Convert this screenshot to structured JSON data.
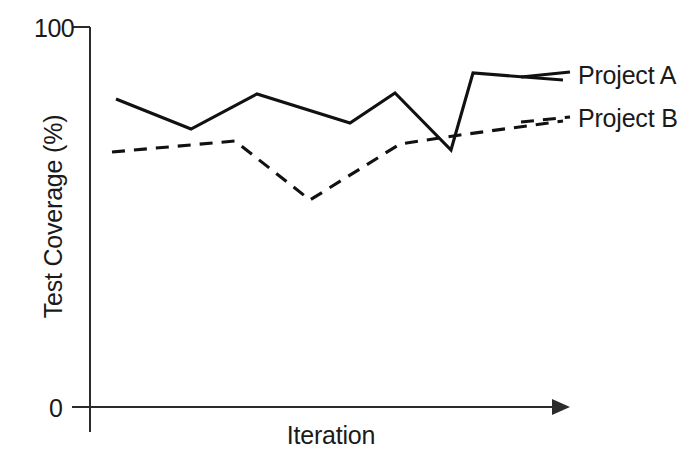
{
  "chart_data": {
    "type": "line",
    "title": "",
    "xlabel": "Iteration",
    "ylabel": "Test Coverage (%)",
    "ylim": [
      0,
      100
    ],
    "ytick_labels": [
      "100",
      "0"
    ],
    "ytick_values": [
      100,
      0
    ],
    "xtick_labels": [],
    "grid": false,
    "legend_position": "right",
    "x": [
      1,
      2,
      3,
      4,
      5,
      6,
      7,
      8
    ],
    "series": [
      {
        "name": "Project A",
        "style": "solid",
        "color": "#111111",
        "values": [
          81,
          73,
          82,
          75,
          83,
          66,
          87,
          85
        ]
      },
      {
        "name": "Project B",
        "style": "dashed",
        "color": "#111111",
        "values": [
          67,
          70,
          54,
          68,
          71,
          75,
          75,
          75
        ]
      }
    ],
    "geometry": {
      "note": "pixel polyline vertices as drawn in the source figure",
      "solid_points": "116,99 191,129 257,94 350,123 395,93 451,150 473,73 563,80",
      "dashed_points": "112,152 235,141 310,200 400,144 460,135 563,121",
      "y_axis": {
        "x": 90,
        "y_top": 27,
        "y_bottom": 432
      },
      "x_axis": {
        "y": 407,
        "x_left": 72,
        "x_right": 563
      },
      "top_tick": {
        "y": 27,
        "x_from": 72,
        "x_to": 90
      },
      "zero_tick": {
        "y": 407,
        "x_from": 72,
        "x_to": 90
      }
    }
  },
  "legend": {
    "items": [
      {
        "label": "Project A",
        "style": "solid"
      },
      {
        "label": "Project B",
        "style": "dashed"
      }
    ]
  },
  "axes": {
    "y_title": "Test Coverage (%)",
    "x_title": "Iteration",
    "y_max_label": "100",
    "y_min_label": "0"
  },
  "colors": {
    "ink": "#111111",
    "axis": "#2b2b2b",
    "background": "#ffffff"
  }
}
